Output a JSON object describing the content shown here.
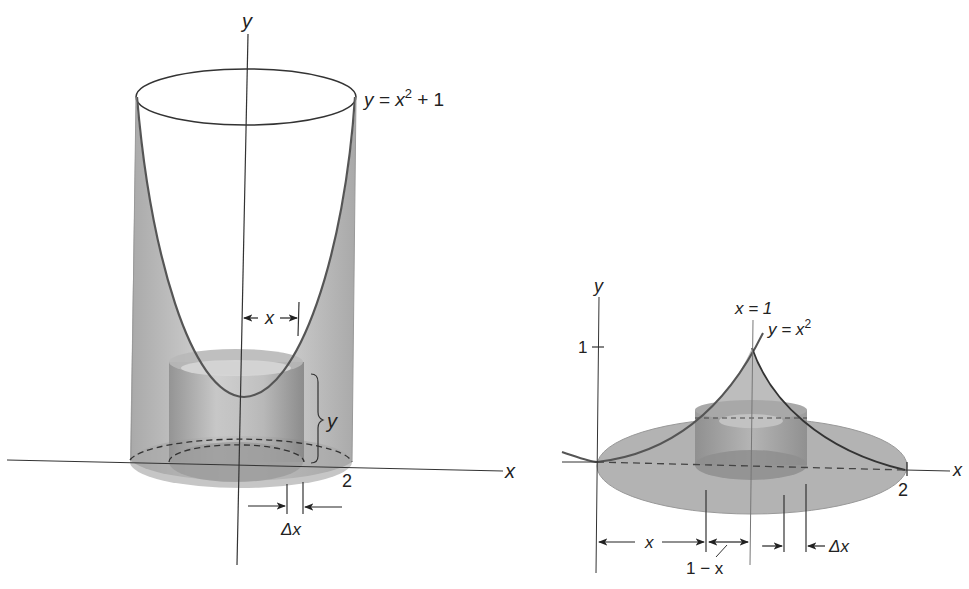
{
  "left_figure": {
    "y_axis_label": "y",
    "x_axis_label": "x",
    "curve_label": {
      "prefix": "y = x",
      "sup": "2",
      "suffix": " + 1"
    },
    "x_tick": "2",
    "radius_label": "x",
    "height_label": "y",
    "delta_label": "Δx"
  },
  "right_figure": {
    "y_axis_label": "y",
    "x_axis_label": "x",
    "y_tick": "1",
    "x_tick": "2",
    "line_label": "x = 1",
    "curve_label": {
      "prefix": "y = x",
      "sup": "2"
    },
    "x_dim_label": "x",
    "one_minus_x_label": "1 − x",
    "delta_label": "Δx"
  },
  "colors": {
    "line": "#333333",
    "shade": "#9a9a9a",
    "shade_light": "#c8c8c8"
  }
}
